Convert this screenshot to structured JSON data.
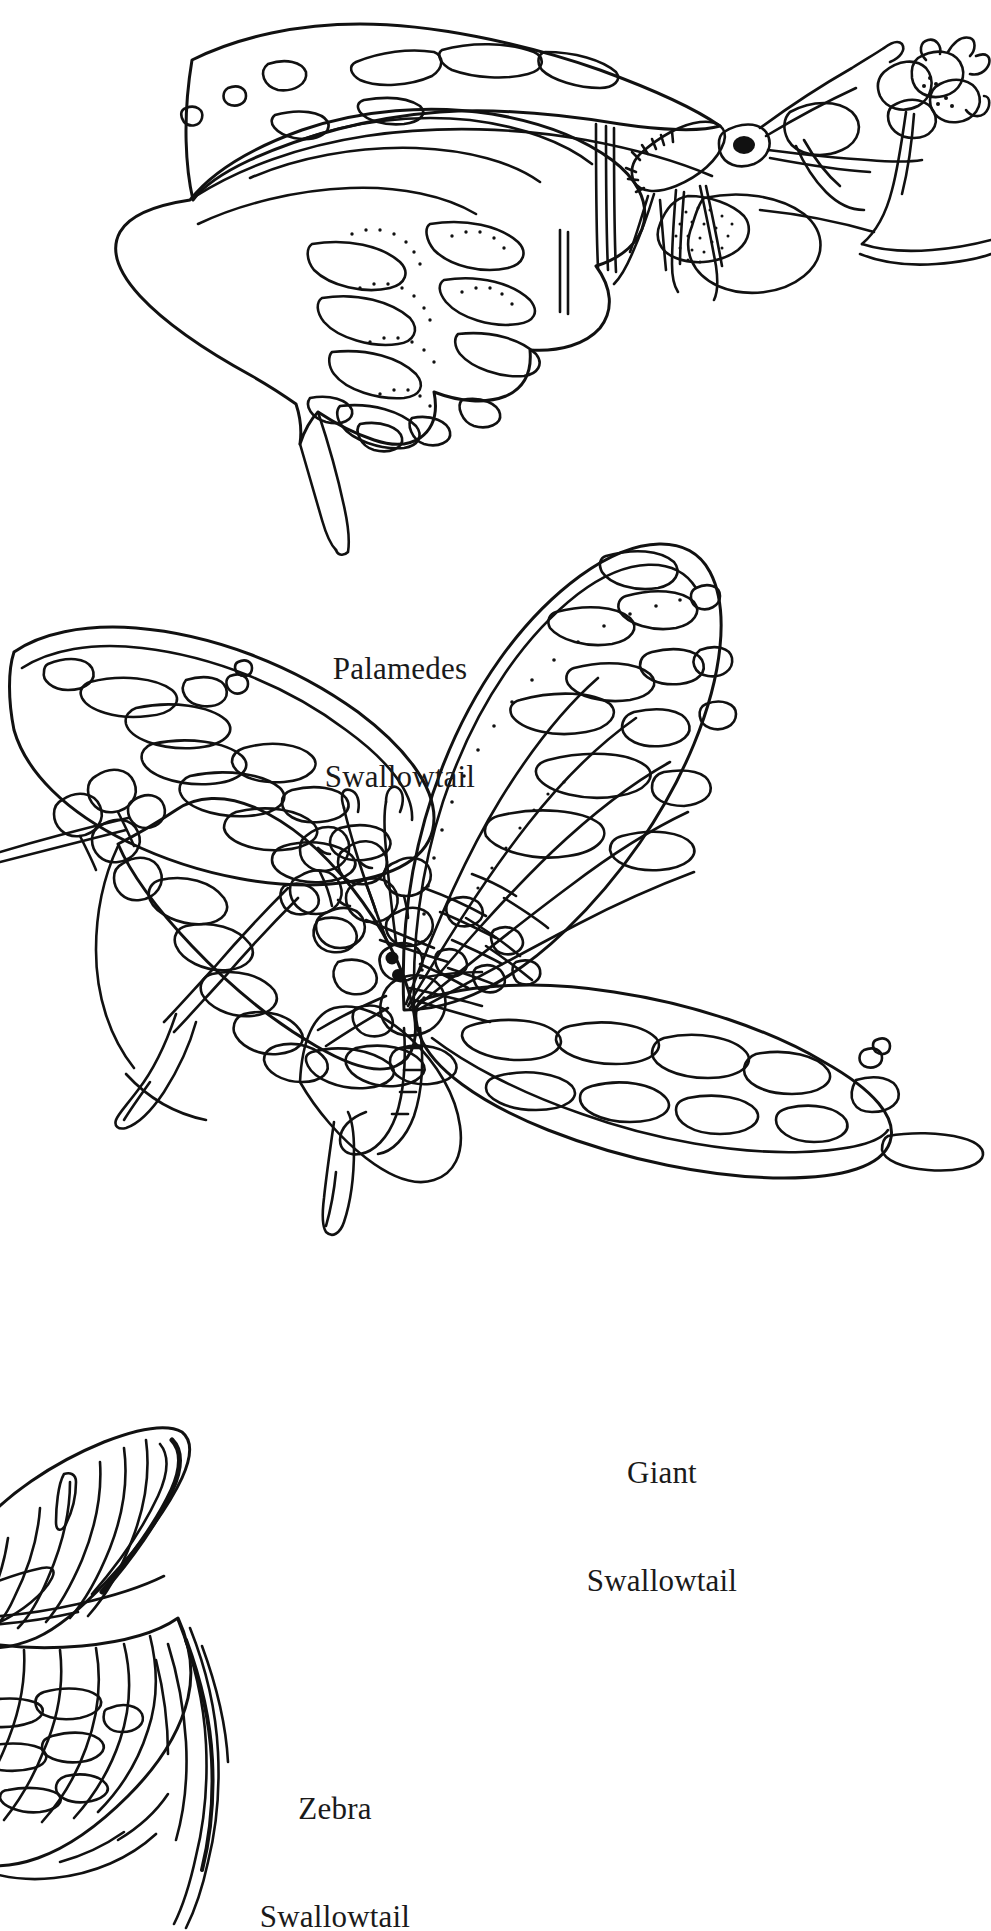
{
  "page": {
    "kind": "coloring-book-plate",
    "background_color": "#ffffff",
    "ink_color": "#111111",
    "width": 991,
    "height": 1931
  },
  "captions": {
    "palamedes": {
      "line1": "Palamedes",
      "line2": "Swallowtail"
    },
    "giant": {
      "line1": "Giant",
      "line2": "Swallowtail"
    },
    "zebra": {
      "line1": "Zebra",
      "line2": "Swallowtail"
    }
  },
  "figures": [
    {
      "name": "palamedes-swallowtail",
      "label": "Palamedes Swallowtail",
      "pose": "side view, wings closed, perched on flower cluster",
      "details": [
        "forewing pale spot band",
        "hindwing scalloped margin with stippled crescents",
        "long tail",
        "clubbed antenna",
        "coiled proboscis",
        "flower spray at right"
      ]
    },
    {
      "name": "giant-swallowtail",
      "label": "Giant Swallowtail",
      "pose": "wings spread, nectaring on blossom cluster",
      "details": [
        "diagonal band of blocky pale spots across forewings",
        "hindwing spot row and spatulate tails",
        "dotted vein shading",
        "flower cluster at center-left"
      ]
    },
    {
      "name": "zebra-swallowtail",
      "label": "Zebra Swallowtail",
      "pose": "partial view, wing cropped at lower-left corner",
      "details": [
        "bold vertical stripes",
        "pale chevrons along margin",
        "long sword-like tail"
      ]
    }
  ]
}
